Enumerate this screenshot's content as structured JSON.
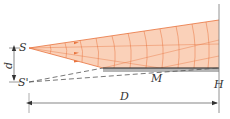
{
  "diagram": {
    "labels": {
      "source": "S",
      "image": "S'",
      "distance_d": "d",
      "distance_D": "D",
      "mirror_point": "M",
      "wall_point": "H"
    },
    "colors": {
      "fan_fill": "#f9c9ad",
      "fan_stroke": "#e8723c",
      "mirror_fill": "#b5b5b5",
      "mirror_edge": "#222222",
      "dashed": "#555555",
      "line": "#777777",
      "text": "#333333"
    }
  }
}
